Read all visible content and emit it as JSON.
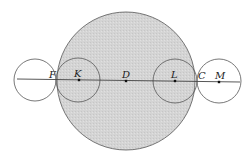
{
  "diagram": {
    "colors": {
      "big_circle_fill": "#d6d6d6",
      "stroke": "#555555",
      "line": "#444444"
    },
    "big_circle": {
      "cx": 126,
      "cy": 81,
      "r": 69
    },
    "small_circles": [
      {
        "name": "left-outer",
        "cx": 35,
        "cy": 80,
        "r": 21
      },
      {
        "name": "K",
        "cx": 78,
        "cy": 80,
        "r": 22
      },
      {
        "name": "L",
        "cx": 175,
        "cy": 81,
        "r": 22
      },
      {
        "name": "M",
        "cx": 219,
        "cy": 81,
        "r": 22
      }
    ],
    "axis_line": {
      "x1": 17,
      "y1": 79,
      "x2": 240,
      "y2": 82
    },
    "points": [
      {
        "label": "F",
        "x": 56,
        "y": 80,
        "dot": false,
        "lx": 49,
        "ly": 78
      },
      {
        "label": "K",
        "x": 79,
        "y": 80,
        "dot": true,
        "lx": 74,
        "ly": 77
      },
      {
        "label": "D",
        "x": 126,
        "y": 81,
        "dot": true,
        "lx": 122,
        "ly": 78
      },
      {
        "label": "L",
        "x": 175,
        "y": 81,
        "dot": true,
        "lx": 171,
        "ly": 78
      },
      {
        "label": "C",
        "x": 197,
        "y": 81,
        "dot": false,
        "lx": 198,
        "ly": 79
      },
      {
        "label": "M",
        "x": 219,
        "y": 82,
        "dot": true,
        "lx": 215,
        "ly": 79
      }
    ]
  }
}
